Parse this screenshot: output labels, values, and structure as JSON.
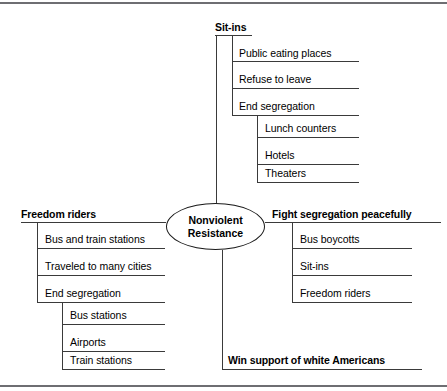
{
  "diagram": {
    "center": {
      "line1": "Nonviolent",
      "line2": "Resistance"
    },
    "branches": {
      "top": {
        "label": "Sit-ins",
        "children": [
          {
            "label": "Public eating places"
          },
          {
            "label": "Refuse to leave"
          },
          {
            "label": "End segregation",
            "children": [
              {
                "label": "Lunch counters"
              },
              {
                "label": "Hotels"
              },
              {
                "label": "Theaters"
              }
            ]
          }
        ]
      },
      "left": {
        "label": "Freedom riders",
        "children": [
          {
            "label": "Bus and train stations"
          },
          {
            "label": "Traveled to many cities"
          },
          {
            "label": "End segregation",
            "children": [
              {
                "label": "Bus stations"
              },
              {
                "label": "Airports"
              },
              {
                "label": "Train stations"
              }
            ]
          }
        ]
      },
      "right": {
        "label": "Fight segregation peacefully",
        "children": [
          {
            "label": "Bus boycotts"
          },
          {
            "label": "Sit-ins"
          },
          {
            "label": "Freedom riders"
          }
        ]
      },
      "bottom": {
        "label": "Win support of white Americans"
      }
    }
  },
  "colors": {
    "rule": "#3a3a3a",
    "edge_bar": "#6e6e72",
    "text": "#000000",
    "background": "#ffffff"
  }
}
